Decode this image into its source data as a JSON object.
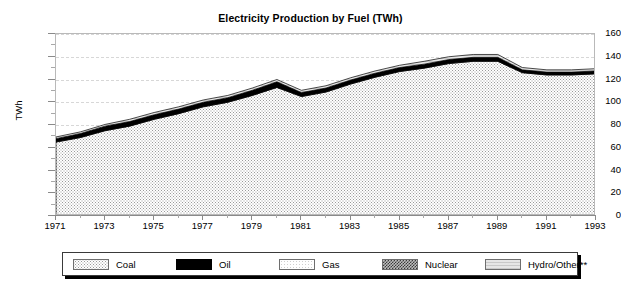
{
  "chart_data": {
    "type": "area",
    "title": "Electricity Production by Fuel (TWh)",
    "xlabel": "",
    "ylabel": "TWh",
    "ylim": [
      0,
      160
    ],
    "ytick_step": 20,
    "yticks": [
      0,
      20,
      40,
      60,
      80,
      100,
      120,
      140,
      160
    ],
    "ytick_labels": [
      "0",
      "20",
      "40",
      "60",
      "80",
      "100",
      "120",
      "140",
      "160"
    ],
    "xlim": [
      1971,
      1993
    ],
    "x": [
      1971,
      1972,
      1973,
      1974,
      1975,
      1976,
      1977,
      1978,
      1979,
      1980,
      1981,
      1982,
      1983,
      1984,
      1985,
      1986,
      1987,
      1988,
      1989,
      1990,
      1991,
      1992,
      1993
    ],
    "xtick_labels": [
      "1971",
      "1973",
      "1975",
      "1977",
      "1979",
      "1981",
      "1983",
      "1985",
      "1987",
      "1989",
      "1991",
      "1993"
    ],
    "xtick_values": [
      1971,
      1973,
      1975,
      1977,
      1979,
      1981,
      1983,
      1985,
      1987,
      1989,
      1991,
      1993
    ],
    "grid": true,
    "grid_axis": "y",
    "legend_position": "bottom",
    "stacked": true,
    "series": [
      {
        "name": "Coal",
        "pattern": "coal",
        "values": [
          65,
          69,
          75,
          79,
          85,
          90,
          96,
          100,
          106,
          113,
          105,
          109,
          116,
          122,
          127,
          130,
          134,
          136,
          136,
          126,
          124,
          124,
          125
        ]
      },
      {
        "name": "Oil",
        "pattern": "oil",
        "values": [
          3,
          3.5,
          4,
          4,
          4,
          4,
          4,
          4,
          4.5,
          5,
          3.5,
          3.5,
          3.5,
          3.5,
          3.5,
          3.5,
          3.5,
          3.5,
          3.5,
          2.5,
          2.5,
          2.5,
          2.5
        ]
      },
      {
        "name": "Gas",
        "pattern": "gas",
        "values": [
          0,
          0,
          0,
          0,
          0,
          0,
          0,
          0,
          0,
          0,
          0,
          0,
          0,
          0,
          0,
          0,
          0,
          0,
          0,
          0,
          0,
          0,
          0
        ]
      },
      {
        "name": "Nuclear",
        "pattern": "nuclear",
        "values": [
          0,
          0,
          0,
          0,
          0,
          0,
          0,
          0,
          0,
          0,
          0,
          0,
          0,
          0,
          0,
          0,
          0,
          0,
          0,
          0,
          0,
          0,
          0
        ]
      },
      {
        "name": "Hydro/Other**",
        "pattern": "hydro",
        "values": [
          1.5,
          1.5,
          1.5,
          2,
          2,
          2,
          2,
          2,
          2,
          2,
          2,
          2,
          2,
          2,
          2,
          2.5,
          2.5,
          2.5,
          2.5,
          2,
          2,
          2,
          2
        ]
      }
    ],
    "totals": [
      69.5,
      74,
      80.5,
      85,
      91,
      96,
      102,
      106,
      112.5,
      120,
      110.5,
      114.5,
      121.5,
      127.5,
      132.5,
      136,
      140,
      142,
      142,
      130.5,
      128.5,
      128.5,
      129.5
    ]
  },
  "legend": {
    "items": [
      {
        "label": "Coal",
        "pattern": "coal"
      },
      {
        "label": "Oil",
        "pattern": "oil"
      },
      {
        "label": "Gas",
        "pattern": "gas"
      },
      {
        "label": "Nuclear",
        "pattern": "nuclear"
      },
      {
        "label": "Hydro/Other**",
        "pattern": "hydro"
      }
    ]
  },
  "colors": {
    "oil": "#000000",
    "coal_fill": "#9a9a9a",
    "gas_fill": "#cfcfcf",
    "nuclear_fill": "#3a3a3a",
    "hydro_fill": "#e6e6e6",
    "axis": "#8a8a8a",
    "grid": "#d7d7d7",
    "frame": "#b9b9b9"
  }
}
